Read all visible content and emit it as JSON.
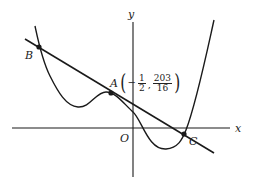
{
  "diagram": {
    "type": "function-graph",
    "axes": {
      "x_label": "x",
      "y_label": "y",
      "origin_label": "O"
    },
    "points": {
      "A": {
        "label": "A",
        "coord_x_sign": "−",
        "coord_x_num": "1",
        "coord_x_den": "2",
        "coord_y_num": "203",
        "coord_y_den": "16",
        "separator": ","
      },
      "B": {
        "label": "B"
      },
      "C": {
        "label": "C"
      }
    },
    "colors": {
      "stroke": "#1a1a1a",
      "background": "#ffffff"
    }
  }
}
